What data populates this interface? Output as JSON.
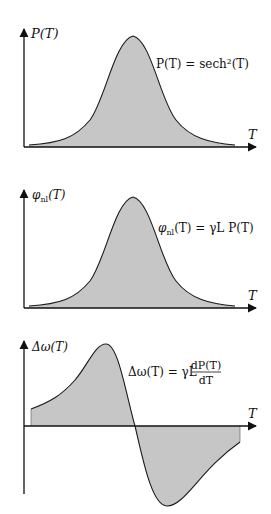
{
  "colors": {
    "fill": "#c6c6c6",
    "stroke": "#1a1a1a",
    "axis": "#111111",
    "background": "#ffffff"
  },
  "panels": [
    {
      "name": "power-panel",
      "y_label": "P(T)",
      "x_label": "T",
      "equation": "P(T) = sech²(T)",
      "curve": "sech^2 pulse"
    },
    {
      "name": "phase-panel",
      "y_label": "φnl(T)",
      "y_label_main": "φ",
      "y_label_sub": "nl",
      "y_label_rest": "(T)",
      "x_label": "T",
      "equation_lhs_main": "φ",
      "equation_lhs_sub": "nl",
      "equation_rest": "(T) = γL P(T)",
      "curve": "sech^2 pulse scaled by γL"
    },
    {
      "name": "frequency-shift-panel",
      "y_label": "Δω(T)",
      "x_label": "T",
      "equation_lhs": "Δω(T) = γL",
      "equation_num": "dP(T)",
      "equation_den": "dT",
      "curve": "derivative of sech^2 (positive lobe then negative lobe)"
    }
  ]
}
